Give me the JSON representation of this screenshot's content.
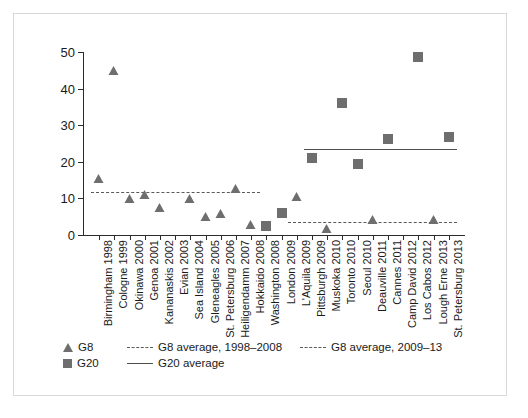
{
  "chart_data": {
    "type": "scatter",
    "title": "",
    "xlabel": "",
    "ylabel": "",
    "ylim": [
      0,
      50
    ],
    "yticks": [
      0,
      10,
      20,
      30,
      40,
      50
    ],
    "grid": false,
    "legend_position": "bottom-left",
    "categories": [
      "Birmingham 1998",
      "Cologne 1999",
      "Okinawa 2000",
      "Genoa 2001",
      "Kananaskis 2002",
      "Evian 2003",
      "Sea Island 2004",
      "Gleneagles 2005",
      "St. Petersburg 2006",
      "Heiligendamm 2007",
      "Hokkaido 2008",
      "Washington 2008",
      "London 2009",
      "L'Aquila 2009",
      "Pittsburgh 2009",
      "Muskoka 2010",
      "Toronto 2010",
      "Seoul 2010",
      "Deauville 2011",
      "Cannes 2011",
      "Camp David 2012",
      "Los Cabos 2012",
      "Lough Erne 2013",
      "St. Petersburg 2013"
    ],
    "series": [
      {
        "name": "G8",
        "marker": "triangle",
        "color": "#6e6e6e",
        "points": [
          {
            "category": "Birmingham 1998",
            "value": 14.5
          },
          {
            "category": "Cologne 1999",
            "value": 44.0
          },
          {
            "category": "Okinawa 2000",
            "value": 9.0
          },
          {
            "category": "Genoa 2001",
            "value": 10.0
          },
          {
            "category": "Kananaskis 2002",
            "value": 6.5
          },
          {
            "category": "Sea Island 2004",
            "value": 9.0
          },
          {
            "category": "Gleneagles 2005",
            "value": 4.0
          },
          {
            "category": "St. Petersburg 2006",
            "value": 4.8
          },
          {
            "category": "Heiligendamm 2007",
            "value": 11.8
          },
          {
            "category": "Hokkaido 2008",
            "value": 1.8
          },
          {
            "category": "L'Aquila 2009",
            "value": 9.5
          },
          {
            "category": "Muskoka 2010",
            "value": 0.8
          },
          {
            "category": "Deauville 2011",
            "value": 3.2
          },
          {
            "category": "Lough Erne 2013",
            "value": 3.2
          }
        ]
      },
      {
        "name": "G20",
        "marker": "square",
        "color": "#6e6e6e",
        "points": [
          {
            "category": "Washington 2008",
            "value": 2.5
          },
          {
            "category": "London 2009",
            "value": 6.0
          },
          {
            "category": "Pittsburgh 2009",
            "value": 21.0
          },
          {
            "category": "Toronto 2010",
            "value": 36.0
          },
          {
            "category": "Seoul 2010",
            "value": 19.5
          },
          {
            "category": "Cannes 2011",
            "value": 26.3
          },
          {
            "category": "Los Cabos 2012",
            "value": 48.7
          },
          {
            "category": "St. Petersburg 2013",
            "value": 26.8
          }
        ]
      }
    ],
    "reference_lines": [
      {
        "name": "G8 average, 1998–2008",
        "style": "dashed",
        "value": 11.7,
        "from_category": "Birmingham 1998",
        "to_category": "Hokkaido 2008"
      },
      {
        "name": "G8 average, 2009–13",
        "style": "dotted",
        "value": 3.5,
        "from_category": "L'Aquila 2009",
        "to_category": "St. Petersburg 2013"
      },
      {
        "name": "G20 average",
        "style": "solid",
        "value": 23.5,
        "from_category": "Pittsburgh 2009",
        "to_category": "St. Petersburg 2013"
      }
    ]
  },
  "legend": {
    "items": [
      {
        "label": "G8",
        "key": "triangle-marker"
      },
      {
        "label": "G8 average, 1998–2008",
        "key": "dashed-line"
      },
      {
        "label": "G8 average, 2009–13",
        "key": "dotted-line"
      },
      {
        "label": "G20",
        "key": "square-marker"
      },
      {
        "label": "G20 average",
        "key": "solid-line"
      }
    ]
  }
}
